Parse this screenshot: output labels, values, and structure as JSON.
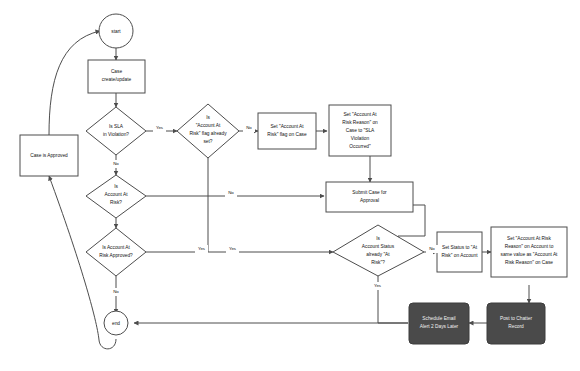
{
  "diagram": {
    "background_color": "#ffffff",
    "stroke_color": "#4d4d4d",
    "dark_node_fill": "#4a4a4a",
    "dark_node_text_color": "#f2f2f2",
    "node_text_color": "#111111"
  },
  "nodes": {
    "start": {
      "label": "start",
      "shape": "circle"
    },
    "case_create_update": {
      "label_line_1": "Case",
      "label_line_2": "create/update",
      "shape": "rectangle"
    },
    "is_sla_in_violation": {
      "label_line_1": "Is SLA",
      "label_line_2": "in Violation?",
      "shape": "diamond"
    },
    "is_aar_flag_set": {
      "label_line_1": "Is",
      "label_line_2": "\"Account At",
      "label_line_3": "Risk\" flag already",
      "label_line_4": "set?",
      "shape": "diamond"
    },
    "set_aar_flag": {
      "label_line_1": "Set \"Account At",
      "label_line_2": "Risk\" flag on Case",
      "shape": "rectangle"
    },
    "set_aar_reason_case": {
      "label_line_1": "Set \"Account At",
      "label_line_2": "Risk Reason\" on",
      "label_line_3": "Case to \"SLA",
      "label_line_4": "Violation",
      "label_line_5": "Occurred\"",
      "shape": "rectangle"
    },
    "is_account_at_risk": {
      "label_line_1": "Is",
      "label_line_2": "Account At",
      "label_line_3": "Risk?",
      "shape": "diamond"
    },
    "submit_case_for_approval": {
      "label_line_1": "Submit Case for",
      "label_line_2": "Approval",
      "shape": "rectangle"
    },
    "is_account_at_risk_approved": {
      "label_line_1": "Is Account At",
      "label_line_2": "Risk Approved?",
      "shape": "diamond"
    },
    "is_account_status_at_risk": {
      "label_line_1": "Is",
      "label_line_2": "Account Status",
      "label_line_3": "already \"At",
      "label_line_4": "Risk\"?",
      "shape": "diamond"
    },
    "set_status_at_risk_account": {
      "label_line_1": "Set Status to \"At",
      "label_line_2": "Risk\" on Account",
      "shape": "rectangle"
    },
    "set_aar_reason_account": {
      "label_line_1": "Set \"Account At Risk",
      "label_line_2": "Reason\" on Account to",
      "label_line_3": "same value as \"Account At",
      "label_line_4": "Risk Reason\" on Case",
      "shape": "rectangle"
    },
    "post_to_chatter": {
      "label_line_1": "Post to Chatter",
      "label_line_2": "Record",
      "shape": "rounded-rectangle-dark"
    },
    "schedule_email_alert": {
      "label_line_1": "Schedule Email",
      "label_line_2": "Alert 2 Days Later",
      "shape": "rounded-rectangle-dark"
    },
    "case_is_approved": {
      "label": "Case is Approved",
      "shape": "rectangle"
    },
    "end": {
      "label": "end",
      "shape": "circle"
    }
  },
  "edge_labels": {
    "sla_yes": "Yes",
    "sla_no": "No",
    "aar_flag_no": "No",
    "account_at_risk_no": "No",
    "approved_yes_left": "Yes",
    "approved_yes_right": "Yes",
    "approved_no": "No",
    "status_no": "No",
    "status_yes": "Yes"
  }
}
